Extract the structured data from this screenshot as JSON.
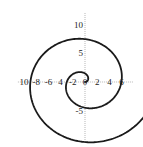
{
  "chart_data": {
    "type": "line",
    "title": "",
    "xlabel": "",
    "ylabel": "",
    "xlim": [
      -11,
      8
    ],
    "ylim": [
      -10.5,
      12
    ],
    "x_ticks": [
      -10,
      -8,
      -6,
      -4,
      -2,
      0,
      2,
      4,
      6
    ],
    "x_tick_labels": [
      "10",
      "-8",
      "-6",
      "4",
      "-2",
      "0",
      "2",
      "4",
      "6"
    ],
    "y_ticks": [
      10,
      5,
      -5
    ],
    "y_tick_labels": [
      "10",
      "5",
      "-5"
    ],
    "grid": false,
    "axes_style": "dotted",
    "series": [
      {
        "name": "spiral",
        "equation": "r = t",
        "t_range": [
          0,
          12.2
        ],
        "color": "#1a1a1a"
      }
    ]
  }
}
